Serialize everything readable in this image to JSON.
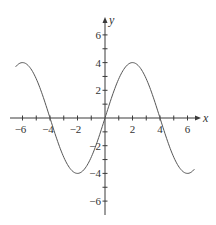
{
  "chart_data": {
    "type": "line",
    "title": "",
    "xlabel": "x",
    "ylabel": "y",
    "xlim": [
      -7,
      7
    ],
    "ylim": [
      -7,
      7
    ],
    "grid": false,
    "legend": null,
    "x_tick_labels": [
      "-6",
      "-4",
      "-2",
      "2",
      "4",
      "6"
    ],
    "x_tick_values": [
      -6,
      -5,
      -4,
      -3,
      -2,
      -1,
      1,
      2,
      3,
      4,
      5,
      6
    ],
    "x_labeled_ticks": [
      -6,
      -4,
      -2,
      2,
      4,
      6
    ],
    "y_tick_labels": [
      "6",
      "4",
      "2",
      "-2",
      "-4",
      "-6"
    ],
    "y_tick_values": [
      -6,
      -5,
      -4,
      -3,
      -2,
      -1,
      1,
      2,
      3,
      4,
      5,
      6
    ],
    "y_labeled_ticks": [
      6,
      4,
      2,
      -2,
      -4,
      -6
    ],
    "series": [
      {
        "name": "f(x) = 4 sin(πx/4)",
        "domain": [
          -6.5,
          6.5
        ],
        "x": [
          -6.5,
          -6,
          -5,
          -4,
          -3,
          -2,
          -1,
          0,
          1,
          2,
          3,
          4,
          5,
          6,
          6.5
        ],
        "y": [
          3.7,
          4,
          2.83,
          0,
          -2.83,
          -4,
          -2.83,
          0,
          2.83,
          4,
          2.83,
          0,
          -2.83,
          -4,
          -3.7
        ],
        "color": "#555555"
      }
    ],
    "annotations": []
  },
  "labels": {
    "x_axis": "x",
    "y_axis": "y"
  }
}
